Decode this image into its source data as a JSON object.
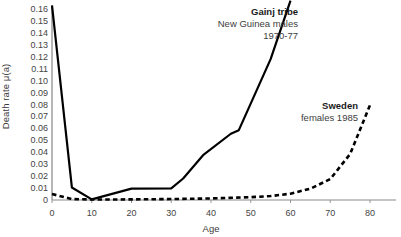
{
  "chart_data": {
    "type": "line",
    "title": "",
    "xlabel": "Age",
    "ylabel": "Death rate μ(a)",
    "xlim": [
      0,
      80
    ],
    "ylim": [
      0,
      0.16
    ],
    "grid": false,
    "legend_position": "inline-annotations",
    "x_ticks": [
      0,
      10,
      20,
      30,
      40,
      50,
      60,
      70,
      80
    ],
    "x_tick_labels": [
      "0",
      "10",
      "20",
      "30",
      "40",
      "50",
      "60",
      "70",
      "80"
    ],
    "y_ticks": [
      0,
      0.01,
      0.02,
      0.03,
      0.04,
      0.05,
      0.06,
      0.07,
      0.08,
      0.09,
      0.1,
      0.11,
      0.12,
      0.13,
      0.14,
      0.15,
      0.16
    ],
    "y_tick_labels": [
      "0",
      "0.01",
      "0.02",
      "0.03",
      "0.04",
      "0.05",
      "0.06",
      "0.07",
      "0.08",
      "0.09",
      "0.10",
      "0.11",
      "0.12",
      "0.13",
      "0.14",
      "0.15",
      "0.16"
    ],
    "series": [
      {
        "name": "Gainj tribe",
        "style": "solid",
        "color": "#000000",
        "x": [
          0,
          5,
          10,
          20,
          30,
          33,
          38,
          45,
          47,
          55,
          60
        ],
        "values": [
          0.163,
          0.0105,
          0.0005,
          0.0095,
          0.0097,
          0.018,
          0.0375,
          0.0555,
          0.0585,
          0.118,
          0.167
        ]
      },
      {
        "name": "Sweden",
        "style": "dashed",
        "color": "#000000",
        "x": [
          0,
          5,
          10,
          20,
          30,
          40,
          50,
          55,
          60,
          65,
          70,
          75,
          80
        ],
        "values": [
          0.005,
          0.0008,
          0.0004,
          0.0005,
          0.0008,
          0.0013,
          0.0024,
          0.0033,
          0.0053,
          0.0095,
          0.0175,
          0.0385,
          0.0795
        ]
      }
    ],
    "annotations": [
      {
        "id": "gainj",
        "title": "Gainj tribe",
        "line2": "New Guinea males",
        "line3": "1970-77"
      },
      {
        "id": "sweden",
        "title": "Sweden",
        "line2": "females 1985",
        "line3": ""
      }
    ]
  }
}
